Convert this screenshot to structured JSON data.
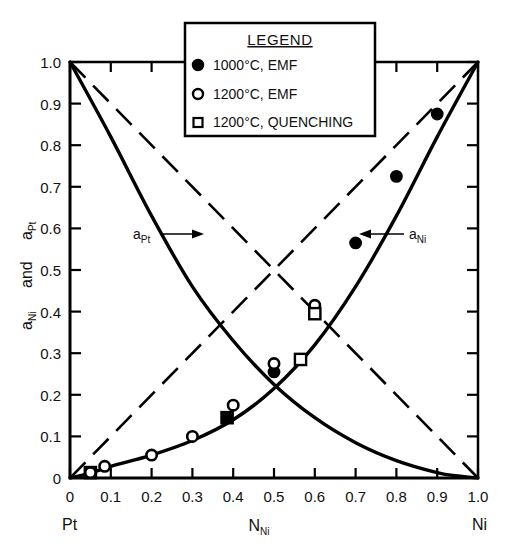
{
  "chart_data": {
    "type": "line",
    "title": "",
    "xlabel": "N_Ni",
    "ylabel": "a_Ni and a_Pt",
    "xlim": [
      0,
      1.0
    ],
    "ylim": [
      0,
      1.0
    ],
    "grid": false,
    "x_tick_labels": [
      "0",
      "0.1",
      "0.2",
      "0.3",
      "0.4",
      "0.5",
      "0.6",
      "0.7",
      "0.8",
      "0.9",
      "1.0"
    ],
    "x_tick_values": [
      0,
      0.1,
      0.2,
      0.3,
      0.4,
      0.5,
      0.6,
      0.7,
      0.8,
      0.9,
      1.0
    ],
    "y_tick_labels": [
      "0",
      "0.1",
      "0.2",
      "0.3",
      "0.4",
      "0.5",
      "0.6",
      "0.7",
      "0.8",
      "0.9",
      "1.0"
    ],
    "y_tick_values": [
      0,
      0.1,
      0.2,
      0.3,
      0.4,
      0.5,
      0.6,
      0.7,
      0.8,
      0.9,
      1.0
    ],
    "x_axis_left_endpoint_label": "Pt",
    "x_axis_right_endpoint_label": "Ni",
    "annotations": [
      {
        "text": "a_Pt",
        "base": "a",
        "sub": "Pt",
        "arrow": "right"
      },
      {
        "text": "a_Ni",
        "base": "a",
        "sub": "Ni",
        "arrow": "left"
      }
    ],
    "series": [
      {
        "name": "a_Ni",
        "style": "solid-curve",
        "description": "Nickel activity curve, negative deviation from Raoult's law",
        "x": [
          0,
          0.05,
          0.1,
          0.2,
          0.3,
          0.4,
          0.5,
          0.6,
          0.7,
          0.8,
          0.9,
          1.0
        ],
        "y": [
          0,
          0.012,
          0.028,
          0.055,
          0.09,
          0.14,
          0.215,
          0.32,
          0.46,
          0.63,
          0.82,
          1.0
        ]
      },
      {
        "name": "a_Pt",
        "style": "solid-curve",
        "description": "Platinum activity curve, negative deviation from Raoult's law",
        "x": [
          0,
          0.1,
          0.2,
          0.3,
          0.4,
          0.5,
          0.6,
          0.7,
          0.8,
          0.9,
          0.95,
          1.0
        ],
        "y": [
          1.0,
          0.82,
          0.63,
          0.46,
          0.33,
          0.225,
          0.145,
          0.085,
          0.042,
          0.013,
          0.005,
          0
        ]
      },
      {
        "name": "ideal-a_Ni",
        "style": "dashed-line",
        "description": "Raoult's law ideal line for Ni",
        "x": [
          0,
          1.0
        ],
        "y": [
          0,
          1.0
        ]
      },
      {
        "name": "ideal-a_Pt",
        "style": "dashed-line",
        "description": "Raoult's law ideal line for Pt",
        "x": [
          0,
          1.0
        ],
        "y": [
          1.0,
          0
        ]
      }
    ],
    "data_points": [
      {
        "x": 0.05,
        "y": 0.013,
        "marker": "open-square",
        "series": "1200 C, QUENCHING"
      },
      {
        "x": 0.05,
        "y": 0.013,
        "marker": "open-circle",
        "series": "1200 C, EMF"
      },
      {
        "x": 0.085,
        "y": 0.028,
        "marker": "open-circle",
        "series": "1200 C, EMF"
      },
      {
        "x": 0.2,
        "y": 0.055,
        "marker": "open-circle",
        "series": "1200 C, EMF"
      },
      {
        "x": 0.3,
        "y": 0.1,
        "marker": "open-circle",
        "series": "1200 C, EMF"
      },
      {
        "x": 0.385,
        "y": 0.145,
        "marker": "open-square",
        "series": "1200 C, QUENCHING"
      },
      {
        "x": 0.385,
        "y": 0.145,
        "marker": "filled-circle",
        "series": "1000 C, EMF"
      },
      {
        "x": 0.4,
        "y": 0.175,
        "marker": "open-circle",
        "series": "1200 C, EMF"
      },
      {
        "x": 0.5,
        "y": 0.255,
        "marker": "filled-circle",
        "series": "1000 C, EMF"
      },
      {
        "x": 0.5,
        "y": 0.275,
        "marker": "open-circle",
        "series": "1200 C, EMF"
      },
      {
        "x": 0.565,
        "y": 0.285,
        "marker": "open-square",
        "series": "1200 C, QUENCHING"
      },
      {
        "x": 0.6,
        "y": 0.4,
        "marker": "filled-circle",
        "series": "1000 C, EMF"
      },
      {
        "x": 0.6,
        "y": 0.415,
        "marker": "open-circle",
        "series": "1200 C, EMF"
      },
      {
        "x": 0.6,
        "y": 0.395,
        "marker": "open-square",
        "series": "1200 C, QUENCHING"
      },
      {
        "x": 0.7,
        "y": 0.565,
        "marker": "filled-circle",
        "series": "1000 C, EMF"
      },
      {
        "x": 0.8,
        "y": 0.725,
        "marker": "filled-circle",
        "series": "1000 C, EMF"
      },
      {
        "x": 0.9,
        "y": 0.875,
        "marker": "filled-circle",
        "series": "1000 C, EMF"
      }
    ],
    "legend": {
      "position": "top-center",
      "title": "LEGEND",
      "entries": [
        {
          "marker": "filled-circle",
          "label": "1000°C, EMF"
        },
        {
          "marker": "open-circle",
          "label": "1200°C, EMF"
        },
        {
          "marker": "open-square",
          "label": "1200°C, QUENCHING"
        }
      ]
    },
    "colors": {
      "line": "#000000",
      "axis": "#000000",
      "background": "#ffffff",
      "text": "#111111"
    }
  },
  "axis": {
    "y_label_main": "a",
    "y_label_sub_1": "Ni",
    "y_label_and": "and",
    "y_label_sub_2": "Pt",
    "x_label_main": "N",
    "x_label_sub": "Ni"
  }
}
